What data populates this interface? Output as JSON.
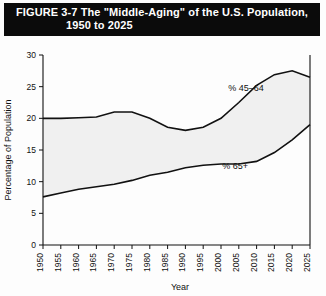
{
  "figure": {
    "title_line_1": "FIGURE 3-7  The \"Middle-Aging\" of the U.S. Population,",
    "title_line_2": "1950 to 2025"
  },
  "chart_data": {
    "type": "area",
    "title": "FIGURE 3-7  The \"Middle-Aging\" of the U.S. Population, 1950 to 2025",
    "xlabel": "Year",
    "ylabel": "Percentage of Population",
    "xlim": [
      1950,
      2025
    ],
    "ylim": [
      0,
      30
    ],
    "xticks": [
      1950,
      1955,
      1960,
      1965,
      1970,
      1975,
      1980,
      1985,
      1990,
      1995,
      2000,
      2005,
      2010,
      2015,
      2020,
      2025
    ],
    "yticks": [
      0,
      5,
      10,
      15,
      20,
      25,
      30
    ],
    "grid": false,
    "legend": "inline-annotations",
    "x": [
      1950,
      1955,
      1960,
      1965,
      1970,
      1975,
      1980,
      1985,
      1990,
      1995,
      2000,
      2005,
      2010,
      2015,
      2020,
      2025
    ],
    "series": [
      {
        "name": "% 45-64",
        "label": "% 45–64",
        "label_x": 2007,
        "label_y": 24.3,
        "values": [
          20.0,
          20.0,
          20.1,
          20.2,
          21.0,
          21.0,
          20.0,
          18.6,
          18.1,
          18.6,
          20.0,
          22.5,
          25.2,
          26.9,
          27.5,
          26.5
        ]
      },
      {
        "name": "% 65+",
        "label": "% 65+",
        "label_x": 2004,
        "label_y": 12.0,
        "values": [
          7.6,
          8.2,
          8.8,
          9.2,
          9.6,
          10.2,
          11.0,
          11.5,
          12.2,
          12.6,
          12.8,
          12.8,
          13.2,
          14.6,
          16.6,
          19.0
        ]
      }
    ],
    "fill_color": "#f0f0f0",
    "line_color": "#111111"
  },
  "axes": {
    "x_title": "Year",
    "y_title": "Percentage of Population"
  }
}
